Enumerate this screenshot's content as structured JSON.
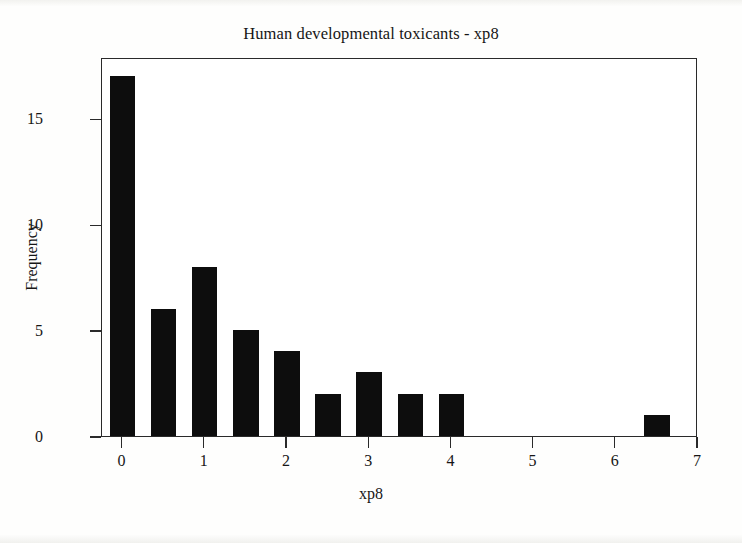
{
  "chart_data": {
    "type": "bar",
    "title": "Human developmental toxicants - xp8",
    "xlabel": "xp8",
    "ylabel": "Frequency",
    "subtype": "histogram",
    "bin_width": 0.5,
    "grid": false,
    "legend": null,
    "xlim": [
      -0.25,
      7.0
    ],
    "ylim": [
      0,
      17.9
    ],
    "x_ticks": [
      0,
      1,
      2,
      3,
      4,
      5,
      6,
      7
    ],
    "x_tick_labels": [
      "0",
      "1",
      "2",
      "3",
      "4",
      "5",
      "6",
      "7"
    ],
    "y_ticks": [
      0,
      5,
      10,
      15
    ],
    "y_tick_labels": [
      "0",
      "5",
      "10",
      "15"
    ],
    "categories": [
      0,
      0.5,
      1,
      1.5,
      2,
      2.5,
      3,
      3.5,
      4,
      4.5,
      5,
      5.5,
      6,
      6.5
    ],
    "values": [
      17,
      6,
      8,
      5,
      4,
      2,
      3,
      2,
      2,
      0,
      0,
      0,
      0,
      1
    ],
    "bar_color": "#0d0d0d",
    "plot_background": "#ffffff",
    "axis_color": "#2a2a2a"
  },
  "figure": {
    "background": "#fdfdfc"
  }
}
